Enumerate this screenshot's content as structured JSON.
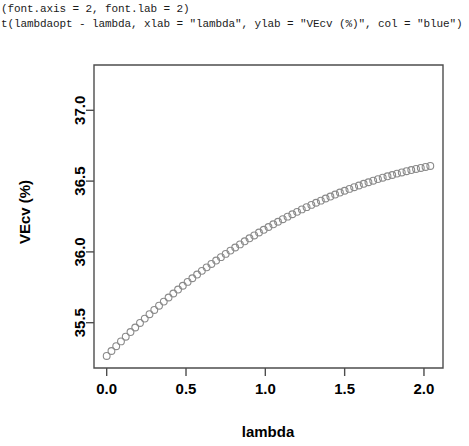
{
  "console": {
    "lines": [
      "(font.axis = 2, font.lab = 2)",
      "t(lambdaopt - lambda, xlab = \"lambda\", ylab = \"VEcv (%)\", col = \"blue\")"
    ]
  },
  "chart_data": {
    "type": "scatter",
    "title": "",
    "xlabel": "lambda",
    "ylabel": "VEcv (%)",
    "xlim": [
      -0.08,
      2.12
    ],
    "ylim": [
      35.18,
      37.32
    ],
    "xticks": [
      "0.0",
      "0.5",
      "1.0",
      "1.5",
      "2.0"
    ],
    "xtick_values": [
      0.0,
      0.5,
      1.0,
      1.5,
      2.0
    ],
    "yticks": [
      "35.5",
      "36.0",
      "36.5",
      "37.0"
    ],
    "ytick_values": [
      35.5,
      36.0,
      36.5,
      37.0
    ],
    "grid": false,
    "legend": null,
    "marker": "open-circle",
    "marker_color": "#8a8a8a",
    "x": [
      0.0,
      0.03,
      0.06,
      0.09,
      0.12,
      0.15,
      0.18,
      0.21,
      0.24,
      0.27,
      0.3,
      0.33,
      0.36,
      0.39,
      0.42,
      0.45,
      0.48,
      0.51,
      0.54,
      0.57,
      0.6,
      0.63,
      0.66,
      0.69,
      0.72,
      0.75,
      0.78,
      0.81,
      0.84,
      0.87,
      0.9,
      0.93,
      0.96,
      0.99,
      1.02,
      1.05,
      1.08,
      1.11,
      1.14,
      1.17,
      1.2,
      1.23,
      1.26,
      1.29,
      1.32,
      1.35,
      1.38,
      1.41,
      1.44,
      1.47,
      1.5,
      1.53,
      1.56,
      1.59,
      1.62,
      1.65,
      1.68,
      1.71,
      1.74,
      1.77,
      1.8,
      1.83,
      1.86,
      1.89,
      1.92,
      1.95,
      1.98,
      2.01,
      2.04
    ],
    "y": [
      35.265,
      35.3,
      35.334,
      35.368,
      35.401,
      35.434,
      35.466,
      35.498,
      35.529,
      35.56,
      35.59,
      35.62,
      35.649,
      35.678,
      35.706,
      35.734,
      35.761,
      35.788,
      35.814,
      35.84,
      35.866,
      35.891,
      35.915,
      35.939,
      35.963,
      35.986,
      36.009,
      36.031,
      36.053,
      36.075,
      36.096,
      36.116,
      36.137,
      36.156,
      36.176,
      36.195,
      36.213,
      36.231,
      36.249,
      36.266,
      36.283,
      36.3,
      36.316,
      36.332,
      36.347,
      36.362,
      36.377,
      36.391,
      36.405,
      36.419,
      36.432,
      36.445,
      36.457,
      36.469,
      36.481,
      36.492,
      36.503,
      36.514,
      36.524,
      36.534,
      36.543,
      36.553,
      36.561,
      36.57,
      36.578,
      36.586,
      36.593,
      36.6,
      36.607
    ]
  }
}
